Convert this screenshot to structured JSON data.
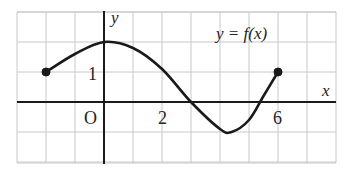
{
  "chart_data": {
    "type": "line",
    "title": "",
    "annotation": "y = f(x)",
    "xlabel": "x",
    "ylabel": "y",
    "origin_label": "O",
    "x_tick_labels": [
      "2",
      "6"
    ],
    "y_tick_labels": [
      "1"
    ],
    "xlim": [
      -3,
      8
    ],
    "ylim": [
      -3,
      3
    ],
    "grid": true,
    "grid_unit": 1,
    "series": [
      {
        "name": "f(x)",
        "x": [
          -2,
          -1,
          0,
          1,
          2,
          3,
          4,
          4.4,
          5,
          5.5,
          6
        ],
        "y": [
          1,
          1.6,
          2,
          1.8,
          1.1,
          0,
          -0.9,
          -1,
          -0.6,
          0.2,
          1
        ]
      }
    ],
    "endpoints": [
      {
        "x": -2,
        "y": 1,
        "filled": true
      },
      {
        "x": 6,
        "y": 1,
        "filled": true
      }
    ]
  }
}
